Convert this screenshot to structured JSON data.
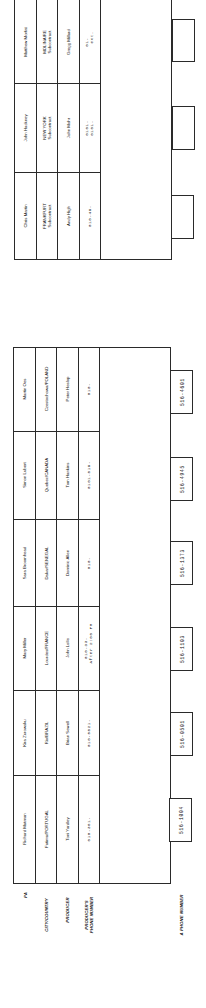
{
  "row_labels": {
    "pa": "PA",
    "city_country": "CITY/COUNTRY",
    "producer": "PRODUCER",
    "producer_phone": "PRODUCER'S\nPHONE NUMBER",
    "a_phone": "A PHONE NUMBER"
  },
  "lower_table": {
    "entries": [
      {
        "pa": "Richard Matman",
        "city": "Fatima/PORTUGAL",
        "producer": "Toni Yardley",
        "phone": "010-351-",
        "a_phone": "516-1004"
      },
      {
        "pa": "Kira Zurowsku",
        "city": "Rio/BRAZIL",
        "producer": "Brian Sewell",
        "phone": "010-5821-",
        "a_phone": "516-0501"
      },
      {
        "pa": "Mary Miller",
        "city": "Lourdes/FRANCE",
        "producer": "John Lolle",
        "phone": "010-33-\n   After 2:00 PM",
        "a_phone": "516-1103"
      },
      {
        "pa": "Sara Broomhead",
        "city": "Dakar/SENEGAL",
        "producer": "Dominic Allen",
        "phone": "010-",
        "a_phone": "516-1373"
      },
      {
        "pa": "Simon Lubert",
        "city": "Quebec/CANADA",
        "producer": "Tom Hankins",
        "phone": "0101-819-",
        "a_phone": "516-4945"
      },
      {
        "pa": "Martin Oes",
        "city": "Czestochowa/POLAND",
        "producer": "Peter Heslop",
        "phone": "010-",
        "a_phone": "516-4601"
      }
    ]
  },
  "upper_table": {
    "entries": [
      {
        "pa": "Chris Martin",
        "city": "FRANKFURT\nSubcontract",
        "producer": "Andy High",
        "phone": "010-49-",
        "a_phone": ""
      },
      {
        "pa": "John Hackney",
        "city": "NEW YORK\nSubcontract",
        "producer": "John Mohr",
        "phone": "0101-\n0101-",
        "a_phone": ""
      },
      {
        "pa": "Matthew Morfat",
        "city": "MOLINAIRE\nSubcontract",
        "producer": "Gregg Millard",
        "phone": "01-\n   ext.",
        "a_phone": ""
      }
    ]
  },
  "colors": {
    "ink": "#2a2a2a",
    "paper": "#ffffff"
  }
}
